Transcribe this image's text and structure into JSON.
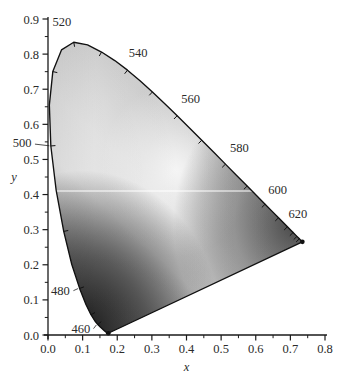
{
  "figure": {
    "kind": "cie-1931-chromaticity-diagram",
    "background": "#ffffff",
    "axis_color": "#1a1a1a",
    "scanline_color": "#ffffff"
  },
  "chart_data": {
    "type": "scatter",
    "title": "",
    "xlabel": "x",
    "ylabel": "y",
    "xlim": [
      0.0,
      0.8
    ],
    "ylim": [
      0.0,
      0.9
    ],
    "grid": false,
    "legend": null,
    "xticks": [
      "0.0",
      "0.1",
      "0.2",
      "0.3",
      "0.4",
      "0.5",
      "0.6",
      "0.7",
      "0.8"
    ],
    "xtick_values": [
      0.0,
      0.1,
      0.2,
      0.3,
      0.4,
      0.5,
      0.6,
      0.7,
      0.8
    ],
    "yticks": [
      "0.0",
      "0.1",
      "0.2",
      "0.3",
      "0.4",
      "0.5",
      "0.6",
      "0.7",
      "0.8",
      "0.9"
    ],
    "ytick_values": [
      0.0,
      0.1,
      0.2,
      0.3,
      0.4,
      0.5,
      0.6,
      0.7,
      0.8,
      0.9
    ],
    "minor_ticks_per_interval": 1,
    "annotations": [
      {
        "label": "460",
        "x": 0.144,
        "y": 0.0297,
        "lx": 0.095,
        "ly": 0.018,
        "leader": true
      },
      {
        "label": "480",
        "x": 0.0913,
        "y": 0.1327,
        "lx": 0.036,
        "ly": 0.128,
        "leader": true
      },
      {
        "label": "500",
        "x": 0.0082,
        "y": 0.5384,
        "lx": -0.075,
        "ly": 0.548,
        "leader": true
      },
      {
        "label": "520",
        "x": 0.0743,
        "y": 0.8338,
        "lx": 0.04,
        "ly": 0.893,
        "leader": false
      },
      {
        "label": "540",
        "x": 0.2296,
        "y": 0.7543,
        "lx": 0.26,
        "ly": 0.805,
        "leader": false
      },
      {
        "label": "560",
        "x": 0.3731,
        "y": 0.6245,
        "lx": 0.412,
        "ly": 0.673,
        "leader": false
      },
      {
        "label": "580",
        "x": 0.5125,
        "y": 0.4866,
        "lx": 0.553,
        "ly": 0.535,
        "leader": false
      },
      {
        "label": "600",
        "x": 0.627,
        "y": 0.3725,
        "lx": 0.663,
        "ly": 0.415,
        "leader": false
      },
      {
        "label": "620",
        "x": 0.6915,
        "y": 0.3083,
        "lx": 0.722,
        "ly": 0.345,
        "leader": false
      }
    ],
    "locus_ticks": [
      {
        "wl": 460,
        "x": 0.144,
        "y": 0.0297
      },
      {
        "wl": 470,
        "x": 0.1241,
        "y": 0.0578
      },
      {
        "wl": 480,
        "x": 0.0913,
        "y": 0.1327
      },
      {
        "wl": 490,
        "x": 0.0454,
        "y": 0.295
      },
      {
        "wl": 500,
        "x": 0.0082,
        "y": 0.5384
      },
      {
        "wl": 510,
        "x": 0.0139,
        "y": 0.7502
      },
      {
        "wl": 520,
        "x": 0.0743,
        "y": 0.8338
      },
      {
        "wl": 530,
        "x": 0.1547,
        "y": 0.8059
      },
      {
        "wl": 540,
        "x": 0.2296,
        "y": 0.7543
      },
      {
        "wl": 550,
        "x": 0.3016,
        "y": 0.6923
      },
      {
        "wl": 560,
        "x": 0.3731,
        "y": 0.6245
      },
      {
        "wl": 570,
        "x": 0.4441,
        "y": 0.5547
      },
      {
        "wl": 580,
        "x": 0.5125,
        "y": 0.4866
      },
      {
        "wl": 590,
        "x": 0.5752,
        "y": 0.4242
      },
      {
        "wl": 600,
        "x": 0.627,
        "y": 0.3725
      },
      {
        "wl": 610,
        "x": 0.6658,
        "y": 0.334
      },
      {
        "wl": 620,
        "x": 0.6915,
        "y": 0.3083
      },
      {
        "wl": 630,
        "x": 0.7079,
        "y": 0.292
      },
      {
        "wl": 640,
        "x": 0.719,
        "y": 0.2809
      },
      {
        "wl": 650,
        "x": 0.726,
        "y": 0.274
      }
    ],
    "locus_path": [
      [
        0.1741,
        0.005
      ],
      [
        0.174,
        0.005
      ],
      [
        0.1738,
        0.0049
      ],
      [
        0.1736,
        0.0049
      ],
      [
        0.1733,
        0.0048
      ],
      [
        0.173,
        0.0048
      ],
      [
        0.1726,
        0.0048
      ],
      [
        0.1721,
        0.0048
      ],
      [
        0.1714,
        0.0051
      ],
      [
        0.1703,
        0.0058
      ],
      [
        0.1689,
        0.0069
      ],
      [
        0.1669,
        0.0086
      ],
      [
        0.1644,
        0.0109
      ],
      [
        0.1611,
        0.0138
      ],
      [
        0.1566,
        0.0177
      ],
      [
        0.151,
        0.0227
      ],
      [
        0.144,
        0.0297
      ],
      [
        0.1355,
        0.0399
      ],
      [
        0.1241,
        0.0578
      ],
      [
        0.1096,
        0.0868
      ],
      [
        0.0913,
        0.1327
      ],
      [
        0.0687,
        0.2007
      ],
      [
        0.0454,
        0.295
      ],
      [
        0.0235,
        0.4127
      ],
      [
        0.0082,
        0.5384
      ],
      [
        0.0039,
        0.6548
      ],
      [
        0.0139,
        0.7502
      ],
      [
        0.0389,
        0.812
      ],
      [
        0.0743,
        0.8338
      ],
      [
        0.1142,
        0.8262
      ],
      [
        0.1547,
        0.8059
      ],
      [
        0.1929,
        0.7816
      ],
      [
        0.2296,
        0.7543
      ],
      [
        0.2658,
        0.7243
      ],
      [
        0.3016,
        0.6923
      ],
      [
        0.3373,
        0.6589
      ],
      [
        0.3731,
        0.6245
      ],
      [
        0.4087,
        0.5896
      ],
      [
        0.4441,
        0.5547
      ],
      [
        0.4788,
        0.5202
      ],
      [
        0.5125,
        0.4866
      ],
      [
        0.5448,
        0.4544
      ],
      [
        0.5752,
        0.4242
      ],
      [
        0.6029,
        0.3965
      ],
      [
        0.627,
        0.3725
      ],
      [
        0.6482,
        0.3514
      ],
      [
        0.6658,
        0.334
      ],
      [
        0.6801,
        0.3197
      ],
      [
        0.6915,
        0.3083
      ],
      [
        0.7006,
        0.2993
      ],
      [
        0.7079,
        0.292
      ],
      [
        0.714,
        0.2859
      ],
      [
        0.719,
        0.2809
      ],
      [
        0.723,
        0.277
      ],
      [
        0.726,
        0.274
      ],
      [
        0.7283,
        0.2717
      ],
      [
        0.73,
        0.27
      ],
      [
        0.7311,
        0.2689
      ],
      [
        0.732,
        0.268
      ],
      [
        0.7327,
        0.2673
      ],
      [
        0.7334,
        0.2666
      ],
      [
        0.734,
        0.266
      ],
      [
        0.7344,
        0.2656
      ],
      [
        0.7346,
        0.2654
      ],
      [
        0.7347,
        0.2653
      ]
    ],
    "purple_line": [
      [
        0.7347,
        0.2653
      ],
      [
        0.1741,
        0.005
      ]
    ],
    "scanline": {
      "y": 0.41,
      "x_from": 0.0,
      "x_to": 0.8
    },
    "corner_points": [
      {
        "name": "red-endpoint",
        "x": 0.7347,
        "y": 0.2653
      },
      {
        "name": "blue-endpoint",
        "x": 0.1741,
        "y": 0.005
      }
    ],
    "gradient_description": "grayscale luminance of CIE gamut: light gray green lobe, bright diagonal band through neutral point, very dark blue-violet corner, medium-dark red corner"
  }
}
